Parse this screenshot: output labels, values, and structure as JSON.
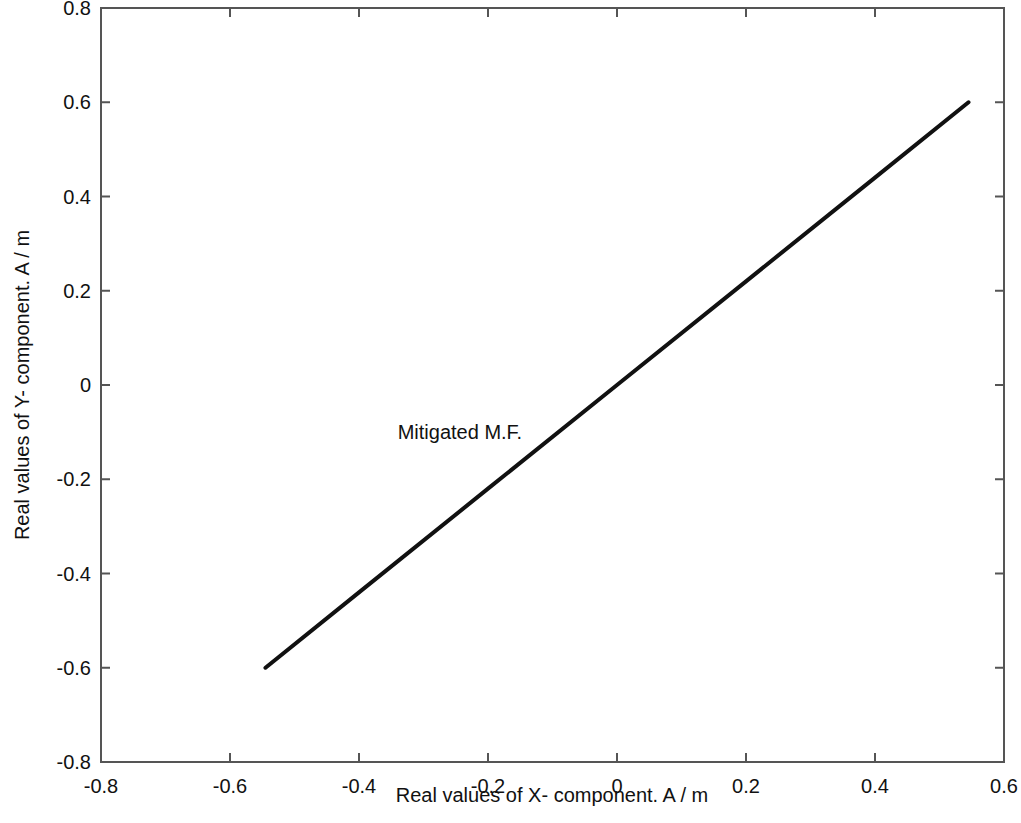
{
  "chart_data": {
    "type": "line",
    "title": "",
    "xlabel": "Real values of X- component. A / m",
    "ylabel": "Real values of Y- component. A / m",
    "xlim": [
      -0.8,
      0.6
    ],
    "ylim": [
      -0.8,
      0.8
    ],
    "xticks": [
      -0.8,
      -0.6,
      -0.4,
      -0.2,
      0,
      0.2,
      0.4,
      0.6
    ],
    "yticks": [
      -0.8,
      -0.6,
      -0.4,
      -0.2,
      0,
      0.2,
      0.4,
      0.6,
      0.8
    ],
    "xtick_labels": [
      "-0.8",
      "-0.6",
      "-0.4",
      "-0.2",
      "0",
      "0.2",
      "0.4",
      "0.6"
    ],
    "ytick_labels": [
      "-0.8",
      "-0.6",
      "-0.4",
      "-0.2",
      "0",
      "0.2",
      "0.4",
      "0.6",
      "0.8"
    ],
    "grid": false,
    "legend_position": "none",
    "series": [
      {
        "name": "Mitigated M.F.",
        "color": "#111111",
        "line_width": 4,
        "x": [
          -0.545,
          -0.4,
          -0.2,
          0.0,
          0.2,
          0.4,
          0.545
        ],
        "y": [
          -0.6,
          -0.44,
          -0.22,
          0.0,
          0.22,
          0.44,
          0.6
        ]
      }
    ],
    "annotations": [
      {
        "text": "Mitigated M.F.",
        "x": -0.34,
        "y": -0.1
      }
    ]
  },
  "axes": {
    "frame_color": "#555555",
    "background": "#ffffff"
  }
}
